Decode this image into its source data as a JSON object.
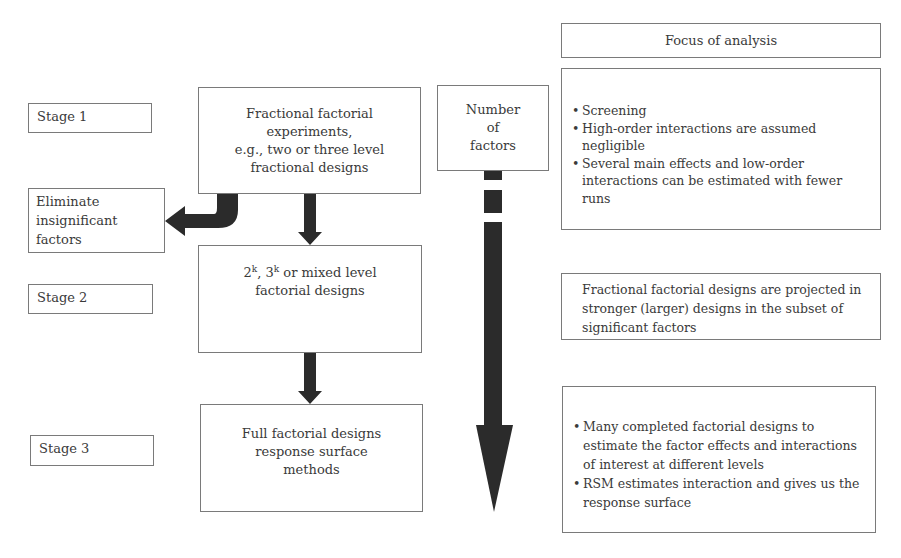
{
  "stages": [
    {
      "label": "Stage 1"
    },
    {
      "label": "Stage 2"
    },
    {
      "label": "Stage 3"
    }
  ],
  "process": {
    "box_a": {
      "lines": [
        "Fractional factorial",
        "experiments,",
        "e.g., two or three level",
        "fractional designs"
      ]
    },
    "box_b": {
      "line1_pre": "2",
      "sup1": "k",
      "line1_mid": ", 3",
      "sup2": "k",
      "line1_post": " or mixed level",
      "line2": "factorial designs"
    },
    "box_c": {
      "lines": [
        "Full factorial designs",
        "response surface",
        "methods"
      ]
    }
  },
  "eliminate": {
    "lines": [
      "Eliminate",
      "insignificant",
      "factors"
    ]
  },
  "number_of_factors": {
    "lines": [
      "Number",
      "of",
      "factors"
    ]
  },
  "focus": {
    "header": "Focus of analysis",
    "stage1_items": [
      "Screening",
      "High-order interactions are assumed negligible",
      "Several main effects and low-order interactions can be estimated with fewer runs"
    ],
    "stage2_text": "Fractional factorial designs are projected in stronger (larger) designs in the subset of significant factors",
    "stage3_items": [
      "Many completed factorial designs to estimate the factor effects and interactions of interest at different levels",
      "RSM estimates interaction and gives us the response surface"
    ]
  },
  "colors": {
    "arrow": "#2b2b2b",
    "border": "#7a7a7a",
    "text": "#3a3a3a"
  }
}
